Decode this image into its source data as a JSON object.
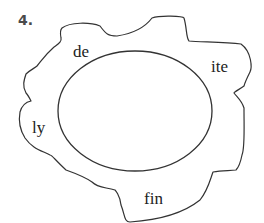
{
  "exercise": {
    "number_label": "4."
  },
  "diagram": {
    "type": "word-web",
    "center_word": "",
    "affixes": [
      {
        "id": "de",
        "text": "de"
      },
      {
        "id": "ite",
        "text": "ite"
      },
      {
        "id": "ly",
        "text": "ly"
      },
      {
        "id": "fin",
        "text": "fin"
      }
    ],
    "colors": {
      "outline": "#333333",
      "ellipse_stroke": "#333333",
      "ellipse_shadow": "#d8d8d8",
      "number_label": "#4a4a4a"
    }
  }
}
